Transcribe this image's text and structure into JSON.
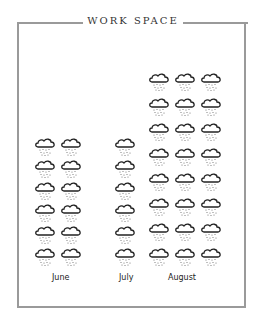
{
  "title": "WORK SPACE",
  "chart_data": {
    "type": "pictograph",
    "title": "WORK SPACE",
    "icon": "rain-cloud-icon",
    "categories": [
      "June",
      "July",
      "August"
    ],
    "values": [
      12,
      6,
      24
    ],
    "layout": [
      {
        "month": "June",
        "columns": 2,
        "rows": 6
      },
      {
        "month": "July",
        "columns": 1,
        "rows": 6
      },
      {
        "month": "August",
        "columns": 3,
        "rows": 8
      }
    ],
    "xlabel": "",
    "ylabel": ""
  },
  "labels": {
    "june": "June",
    "july": "July",
    "august": "August"
  },
  "colors": {
    "frame": "#9a9a9a",
    "ink": "#222222",
    "background": "#ffffff"
  }
}
